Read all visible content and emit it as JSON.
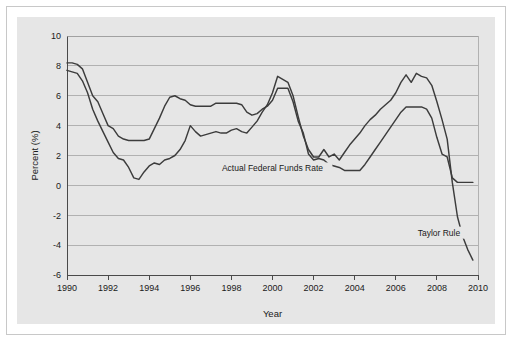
{
  "figure": {
    "background_color": "#e6e6e6",
    "frame_color": "#c8c8c8",
    "page_color": "#ffffff"
  },
  "chart_data": {
    "type": "line",
    "title": "",
    "subtitle": "",
    "xlabel": "Year",
    "ylabel": "Percent (%)",
    "xlim": [
      1990,
      2010
    ],
    "ylim": [
      -6,
      10
    ],
    "grid": true,
    "grid_axis": "y",
    "legend_position": "inline-annotation",
    "xticks": [
      1990,
      1992,
      1994,
      1996,
      1998,
      2000,
      2002,
      2004,
      2006,
      2008,
      2010
    ],
    "xtick_labels": [
      "1990",
      "1992",
      "1994",
      "1996",
      "1998",
      "2000",
      "2002",
      "2004",
      "2006",
      "2008",
      "2010"
    ],
    "yticks": [
      10,
      8,
      6,
      4,
      2,
      0,
      -2,
      -4,
      -6
    ],
    "ytick_labels": [
      "10",
      "8",
      "6",
      "4",
      "2",
      "0",
      "-2",
      "-4",
      "-6"
    ],
    "line_color": "#3c3c3c",
    "annotations": [
      {
        "text": "Actual Federal Funds Rate",
        "x": 2000.0,
        "y": 1.0,
        "anchor": "middle"
      },
      {
        "text": "Taylor Rule",
        "x": 2008.1,
        "y": -3.3,
        "anchor": "middle"
      }
    ],
    "series": [
      {
        "name": "Actual Federal Funds Rate",
        "color": "#3c3c3c",
        "x": [
          1990.0,
          1990.25,
          1990.5,
          1990.75,
          1991.0,
          1991.25,
          1991.5,
          1991.75,
          1992.0,
          1992.25,
          1992.5,
          1992.75,
          1993.0,
          1993.25,
          1993.5,
          1993.75,
          1994.0,
          1994.25,
          1994.5,
          1994.75,
          1995.0,
          1995.25,
          1995.5,
          1995.75,
          1996.0,
          1996.25,
          1996.5,
          1996.75,
          1997.0,
          1997.25,
          1997.5,
          1997.75,
          1998.0,
          1998.25,
          1998.5,
          1998.75,
          1999.0,
          1999.25,
          1999.5,
          1999.75,
          2000.0,
          2000.25,
          2000.5,
          2000.75,
          2001.0,
          2001.25,
          2001.5,
          2001.75,
          2002.0,
          2002.25,
          2002.5,
          2002.75,
          2003.0,
          2003.25,
          2003.5,
          2003.75,
          2004.0,
          2004.25,
          2004.5,
          2004.75,
          2005.0,
          2005.25,
          2005.5,
          2005.75,
          2006.0,
          2006.25,
          2006.5,
          2006.75,
          2007.0,
          2007.25,
          2007.5,
          2007.75,
          2008.0,
          2008.25,
          2008.5,
          2008.75,
          2009.0,
          2009.25,
          2009.5,
          2009.75
        ],
        "values": [
          8.2,
          8.2,
          8.1,
          7.8,
          6.9,
          6.0,
          5.6,
          4.8,
          4.0,
          3.8,
          3.3,
          3.1,
          3.0,
          3.0,
          3.0,
          3.0,
          3.1,
          3.8,
          4.5,
          5.3,
          5.9,
          6.0,
          5.8,
          5.7,
          5.4,
          5.3,
          5.3,
          5.3,
          5.3,
          5.5,
          5.5,
          5.5,
          5.5,
          5.5,
          5.4,
          4.9,
          4.7,
          4.8,
          5.1,
          5.3,
          5.7,
          6.5,
          6.5,
          6.5,
          5.6,
          4.3,
          3.5,
          2.1,
          1.7,
          1.8,
          1.7,
          1.4,
          1.3,
          1.2,
          1.0,
          1.0,
          1.0,
          1.0,
          1.4,
          1.9,
          2.4,
          2.9,
          3.4,
          3.9,
          4.4,
          4.9,
          5.25,
          5.25,
          5.25,
          5.25,
          5.1,
          4.5,
          3.2,
          2.1,
          1.9,
          0.5,
          0.2,
          0.2,
          0.2,
          0.2
        ]
      },
      {
        "name": "Taylor Rule",
        "color": "#3c3c3c",
        "x": [
          1990.0,
          1990.25,
          1990.5,
          1990.75,
          1991.0,
          1991.25,
          1991.5,
          1991.75,
          1992.0,
          1992.25,
          1992.5,
          1992.75,
          1993.0,
          1993.25,
          1993.5,
          1993.75,
          1994.0,
          1994.25,
          1994.5,
          1994.75,
          1995.0,
          1995.25,
          1995.5,
          1995.75,
          1996.0,
          1996.25,
          1996.5,
          1996.75,
          1997.0,
          1997.25,
          1997.5,
          1997.75,
          1998.0,
          1998.25,
          1998.5,
          1998.75,
          1999.0,
          1999.25,
          1999.5,
          1999.75,
          2000.0,
          2000.25,
          2000.5,
          2000.75,
          2001.0,
          2001.25,
          2001.5,
          2001.75,
          2002.0,
          2002.25,
          2002.5,
          2002.75,
          2003.0,
          2003.25,
          2003.5,
          2003.75,
          2004.0,
          2004.25,
          2004.5,
          2004.75,
          2005.0,
          2005.25,
          2005.5,
          2005.75,
          2006.0,
          2006.25,
          2006.5,
          2006.75,
          2007.0,
          2007.25,
          2007.5,
          2007.75,
          2008.0,
          2008.25,
          2008.5,
          2008.75,
          2009.0,
          2009.25,
          2009.5,
          2009.75
        ],
        "values": [
          7.7,
          7.6,
          7.5,
          7.0,
          6.2,
          5.1,
          4.3,
          3.6,
          2.9,
          2.2,
          1.8,
          1.7,
          1.2,
          0.5,
          0.4,
          0.9,
          1.3,
          1.5,
          1.4,
          1.7,
          1.8,
          2.0,
          2.4,
          3.0,
          4.0,
          3.6,
          3.3,
          3.4,
          3.5,
          3.6,
          3.5,
          3.5,
          3.7,
          3.8,
          3.6,
          3.5,
          3.9,
          4.3,
          4.9,
          5.4,
          6.2,
          7.3,
          7.1,
          6.9,
          6.0,
          4.6,
          3.3,
          2.4,
          1.9,
          1.9,
          2.4,
          1.9,
          2.1,
          1.7,
          2.2,
          2.7,
          3.1,
          3.5,
          4.0,
          4.4,
          4.7,
          5.1,
          5.4,
          5.7,
          6.2,
          6.9,
          7.4,
          6.9,
          7.5,
          7.3,
          7.2,
          6.7,
          5.6,
          4.4,
          3.1,
          0.2,
          -2.1,
          -3.4,
          -4.3,
          -5.0
        ]
      }
    ]
  }
}
